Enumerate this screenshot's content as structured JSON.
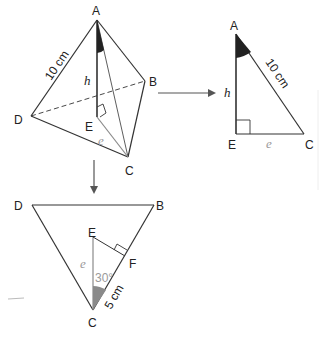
{
  "figure": {
    "pyramid": {
      "vertices": {
        "A": "A",
        "B": "B",
        "C": "C",
        "D": "D",
        "E": "E"
      },
      "edge_label": "10 cm",
      "height_label": "h",
      "base_segment_label": "e"
    },
    "right_triangle": {
      "vertices": {
        "A": "A",
        "E": "E",
        "C": "C"
      },
      "hypotenuse_label": "10 cm",
      "leg_vertical_label": "h",
      "leg_horizontal_label": "e"
    },
    "base_triangle": {
      "vertices": {
        "D": "D",
        "B": "B",
        "C": "C",
        "E": "E",
        "F": "F"
      },
      "segment_label": "e",
      "angle_label": "30°",
      "half_side_label": "5 cm"
    },
    "colors": {
      "line": "#333333",
      "grey_line": "#8a8a8a",
      "angle_fill_dark": "#222222",
      "angle_fill_grey": "#8a8a8a"
    }
  }
}
